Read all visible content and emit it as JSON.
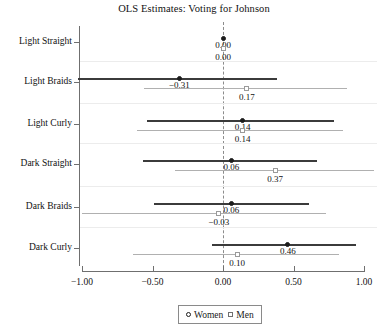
{
  "chart_data": {
    "type": "scatter",
    "title": "OLS Estimates: Voting for Johnson",
    "xlabel": "",
    "ylabel": "",
    "xlim": [
      -1.0,
      1.0
    ],
    "xticks": [
      -1.0,
      -0.5,
      0.0,
      0.5,
      1.0
    ],
    "xtick_labels": [
      "-1.00",
      "-0.50",
      "0.00",
      "0.50",
      "1.00"
    ],
    "categories": [
      "Light Straight",
      "Light Braids",
      "Light Curly",
      "Dark Straight",
      "Dark Braids",
      "Dark Curly"
    ],
    "grid": false,
    "zero_reference_line": 0.0,
    "legend_position": "bottom-center",
    "series": [
      {
        "name": "Women",
        "marker": "filled-circle",
        "color": "#3b3b3b",
        "values": [
          0.0,
          -0.31,
          0.14,
          0.06,
          0.06,
          0.46
        ],
        "value_labels": [
          "0.00",
          "-0.31",
          "0.14",
          "0.06",
          "0.06",
          "0.46"
        ],
        "ci_low": [
          0.0,
          -1.03,
          -0.54,
          -0.57,
          -0.49,
          -0.08
        ],
        "ci_high": [
          0.0,
          0.38,
          0.79,
          0.67,
          0.61,
          0.94
        ]
      },
      {
        "name": "Men",
        "marker": "open-square",
        "color": "#b0b0b0",
        "values": [
          0.0,
          0.17,
          0.14,
          0.37,
          -0.03,
          0.1
        ],
        "value_labels": [
          "0.00",
          "0.17",
          "0.14",
          "0.37",
          "-0.03",
          "0.10"
        ],
        "ci_low": [
          0.0,
          -0.56,
          -0.61,
          -0.34,
          -1.0,
          -0.64
        ],
        "ci_high": [
          0.0,
          0.88,
          0.85,
          1.07,
          0.73,
          0.82
        ]
      }
    ]
  },
  "legend": {
    "items": [
      {
        "label": "Women",
        "marker": "circle"
      },
      {
        "label": "Men",
        "marker": "square"
      }
    ]
  }
}
